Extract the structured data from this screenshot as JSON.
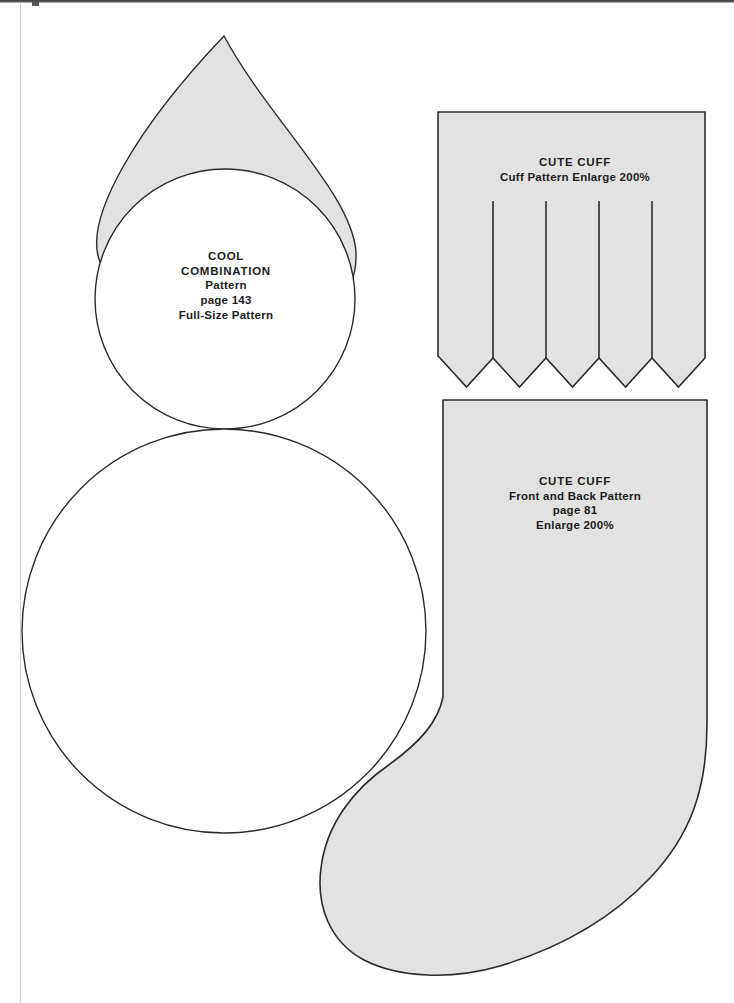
{
  "page": {
    "background_color": "#ffffff",
    "width": 734,
    "height": 1003
  },
  "style": {
    "fill_gray": "#e2e2e2",
    "outline": "#2b2b2b",
    "text_color": "#1c1c1c"
  },
  "patterns": [
    {
      "id": "cool-combination",
      "shape": "teardrop-over-circle",
      "label": {
        "line1": "COOL",
        "line2": "COMBINATION",
        "line3": "Pattern",
        "line4": "page 143",
        "line5": "Full-Size Pattern"
      }
    },
    {
      "id": "cute-cuff-top",
      "shape": "zigzag-cuff",
      "points": 5,
      "slits": 4,
      "label": {
        "line1": "CUTE CUFF",
        "line2": "Cuff Pattern Enlarge 200%"
      }
    },
    {
      "id": "cute-cuff-body",
      "shape": "stocking",
      "label": {
        "line1": "CUTE CUFF",
        "line2": "Front and Back Pattern",
        "line3": "page 81",
        "line4": "Enlarge 200%"
      }
    }
  ],
  "labels": {
    "cool": {
      "line1": "COOL",
      "line2": "COMBINATION",
      "line3": "Pattern",
      "line4": "page 143",
      "line5": "Full-Size Pattern"
    },
    "cuff_top": {
      "line1": "CUTE CUFF",
      "line2": "Cuff Pattern Enlarge 200%"
    },
    "cuff_body": {
      "line1": "CUTE CUFF",
      "line2": "Front and Back Pattern",
      "line3": "page 81",
      "line4": "Enlarge 200%"
    }
  }
}
